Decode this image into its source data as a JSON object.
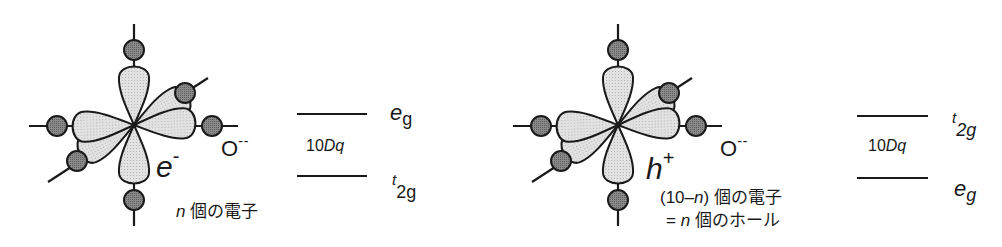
{
  "colors": {
    "line": "#1a1a1a",
    "lobe_fill": "#d9d9d9",
    "oxygen_fill": "#7a7a7a",
    "background": "#ffffff"
  },
  "left_panel": {
    "ion_label": "O",
    "ion_charge": "--",
    "carrier_symbol": "e",
    "carrier_charge": "-",
    "count_var": "n",
    "count_text": " 個の電子",
    "levels": {
      "upper": {
        "main": "e",
        "sub": "g",
        "sup": ""
      },
      "lower": {
        "main": "t",
        "sub": "2g",
        "sup": ""
      },
      "gap_num": "10",
      "gap_var": "Dq"
    }
  },
  "right_panel": {
    "ion_label": "O",
    "ion_charge": "--",
    "carrier_symbol": "h",
    "carrier_charge": "+",
    "line1_prefix": "(10–",
    "line1_var": "n",
    "line1_suffix": ")  個の電子",
    "line2_prefix": "=  ",
    "line2_var": "n",
    "line2_suffix": " 個のホール",
    "levels": {
      "upper": {
        "main": "t",
        "sub": "2g"
      },
      "lower": {
        "main": "e",
        "sub": "g"
      },
      "gap_num": "10",
      "gap_var": "Dq"
    }
  }
}
